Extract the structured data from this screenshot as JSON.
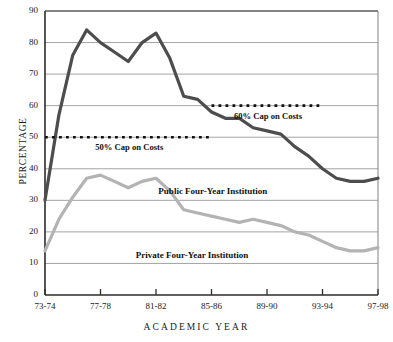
{
  "chart_data": {
    "type": "line",
    "title": "",
    "xlabel": "ACADEMIC YEAR",
    "ylabel": "PERCENTAGE",
    "ylim": [
      0,
      90
    ],
    "ytick_labels": [
      "0",
      "10",
      "20",
      "30",
      "40",
      "50",
      "60",
      "70",
      "80",
      "90"
    ],
    "ytick_values": [
      0,
      10,
      20,
      30,
      40,
      50,
      60,
      70,
      80,
      90
    ],
    "grid": "horizontal",
    "legend_position": "inline-annotations",
    "x": [
      "73-74",
      "74-75",
      "75-76",
      "76-77",
      "77-78",
      "78-79",
      "79-80",
      "80-81",
      "81-82",
      "82-83",
      "83-84",
      "84-85",
      "85-86",
      "86-87",
      "87-88",
      "88-89",
      "89-90",
      "90-91",
      "91-92",
      "92-93",
      "93-94",
      "94-95",
      "95-96",
      "96-97",
      "97-98"
    ],
    "xtick_labels": [
      "73-74",
      "77-78",
      "81-82",
      "85-86",
      "89-90",
      "93-94",
      "97-98"
    ],
    "xtick_indices": [
      0,
      4,
      8,
      12,
      16,
      20,
      24
    ],
    "series": [
      {
        "name": "Public Four-Year Institution",
        "color": "#4d4d4d",
        "values": [
          30,
          57,
          76,
          84,
          80,
          77,
          74,
          80,
          83,
          75,
          63,
          62,
          58,
          56,
          56,
          53,
          52,
          51,
          47,
          44,
          40,
          37,
          36,
          36,
          37
        ]
      },
      {
        "name": "Private Four-Year Institution",
        "color": "#b3b3b3",
        "values": [
          14,
          24,
          31,
          37,
          38,
          36,
          34,
          36,
          37,
          33,
          27,
          26,
          25,
          24,
          23,
          24,
          23,
          22,
          20,
          19,
          17,
          15,
          14,
          14,
          15
        ]
      }
    ],
    "annotations": [
      {
        "name": "50% Cap on Costs",
        "label": "50% Cap on Costs",
        "value": 50,
        "x_start_index": 0,
        "x_end_index": 12,
        "style": "dotted",
        "color": "#111111"
      },
      {
        "name": "60% Cap on Costs",
        "label": "60% Cap on Costs",
        "value": 60,
        "x_start_index": 12,
        "x_end_index": 20,
        "style": "dotted",
        "color": "#111111"
      }
    ],
    "series_labels": [
      {
        "text": "Public Four-Year Institution",
        "x_index": 12.1,
        "value": 32.5
      },
      {
        "text": "Private Four-Year Institution",
        "x_index": 10.6,
        "value": 12.5
      }
    ]
  }
}
